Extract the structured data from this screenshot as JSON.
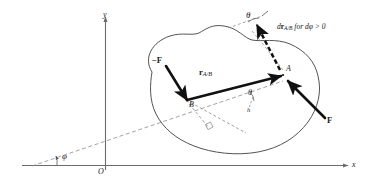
{
  "figure": {
    "type": "mechanics-free-body-diagram",
    "background_color": "#ffffff",
    "stroke_color": "#1a1a1a",
    "axis_color": "#6b6b6b",
    "dash_color": "#8a8a8a",
    "body_outline_color": "#4a4a4a"
  },
  "axes": {
    "x_label": "x",
    "y_label": "y",
    "origin_label": "O"
  },
  "points": {
    "a_label": "A",
    "b_label": "B"
  },
  "vectors": {
    "force_positive_label": "F",
    "force_negative_label": "−F",
    "position_vector_label": "r",
    "position_vector_sub": "A/B",
    "displacement_label": "d",
    "displacement_vector": "r",
    "displacement_sub": "A/B",
    "displacement_condition": "for dφ > 0"
  },
  "angles": {
    "theta_top_label": "θ",
    "theta_mid_label": "θ",
    "phi_label": "φ"
  },
  "dimensions": {
    "moment_arm_label": "h"
  },
  "annotations": {
    "right_angle_marker": "perpendicular",
    "body_shape": "closed irregular blob"
  }
}
